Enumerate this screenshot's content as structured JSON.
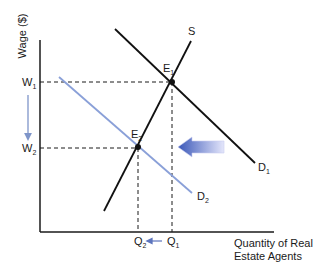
{
  "diagram": {
    "y_axis_label": "Wage ($)",
    "x_axis_label_line1": "Quantity of Real",
    "x_axis_label_line2": "Estate Agents",
    "curves": {
      "supply": {
        "label": "S",
        "color": "#111111"
      },
      "demand_initial": {
        "label": "D",
        "sub": "1",
        "color": "#111111"
      },
      "demand_new": {
        "label": "D",
        "sub": "2",
        "color": "#8aa0d8"
      }
    },
    "equilibria": [
      {
        "label": "E",
        "sub": "1"
      },
      {
        "label": "E",
        "sub": "2"
      }
    ],
    "wage_ticks": [
      {
        "label": "W",
        "sub": "1"
      },
      {
        "label": "W",
        "sub": "2"
      }
    ],
    "quantity_ticks": [
      {
        "label": "Q",
        "sub": "2"
      },
      {
        "label": "Q",
        "sub": "1"
      }
    ],
    "shift_arrow": {
      "direction": "left",
      "gradient_start": "#3a57b8",
      "gradient_end": "#e4e6fb"
    },
    "wage_change_arrow": {
      "direction": "down",
      "color": "#7f95c9"
    },
    "quantity_change_arrow": {
      "direction": "left",
      "color": "#5c74bd"
    }
  }
}
